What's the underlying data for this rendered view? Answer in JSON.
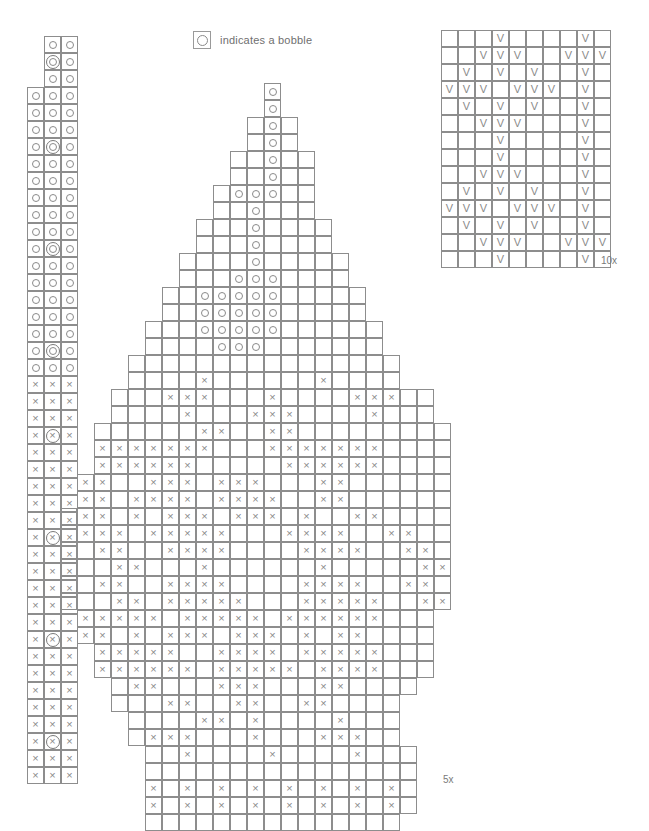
{
  "legend": {
    "icon": "bobble-circle-icon",
    "text": "indicates a bobble"
  },
  "labels": {
    "right_panel_repeat": "10x",
    "main_panel_repeat": "5x"
  },
  "symbols": {
    "empty": "",
    "circle": "o",
    "cross": "x",
    "vee": "V",
    "circle_bobble": "o-bobble",
    "cross_bobble": "x-bobble"
  },
  "chart_data": {
    "type": "table",
    "title": "",
    "cell_px": 17,
    "left_panel": {
      "name": "edging-strip",
      "cols": 3,
      "rows": 44,
      "legend_note": "dot = bobble row every 6th row in center column",
      "grid": [
        [
          null,
          "o",
          "o"
        ],
        [
          null,
          "ob",
          "o"
        ],
        [
          null,
          "o",
          "o"
        ],
        [
          "o",
          "o",
          "o"
        ],
        [
          "o",
          "o",
          "o"
        ],
        [
          "o",
          "o",
          "o"
        ],
        [
          "o",
          "ob",
          "o"
        ],
        [
          "o",
          "o",
          "o"
        ],
        [
          "o",
          "o",
          "o"
        ],
        [
          "o",
          "o",
          "o"
        ],
        [
          "o",
          "o",
          "o"
        ],
        [
          "o",
          "o",
          "o"
        ],
        [
          "o",
          "ob",
          "o"
        ],
        [
          "o",
          "o",
          "o"
        ],
        [
          "o",
          "o",
          "o"
        ],
        [
          "o",
          "o",
          "o"
        ],
        [
          "o",
          "o",
          "o"
        ],
        [
          "o",
          "o",
          "o"
        ],
        [
          "o",
          "ob",
          "o"
        ],
        [
          "o",
          "o",
          "o"
        ],
        [
          "x",
          "x",
          "x"
        ],
        [
          "x",
          "x",
          "x"
        ],
        [
          "x",
          "x",
          "x"
        ],
        [
          "x",
          "xb",
          "x"
        ],
        [
          "x",
          "x",
          "x"
        ],
        [
          "x",
          "x",
          "x"
        ],
        [
          "x",
          "x",
          "x"
        ],
        [
          "x",
          "x",
          "x"
        ],
        [
          "x",
          "x",
          "x"
        ],
        [
          "x",
          "xb",
          "x"
        ],
        [
          "x",
          "x",
          "x"
        ],
        [
          "x",
          "x",
          "x"
        ],
        [
          "x",
          "x",
          "x"
        ],
        [
          "x",
          "x",
          "x"
        ],
        [
          "x",
          "x",
          "x"
        ],
        [
          "x",
          "xb",
          "x"
        ],
        [
          "x",
          "x",
          "x"
        ],
        [
          "x",
          "x",
          "x"
        ],
        [
          "x",
          "x",
          "x"
        ],
        [
          "x",
          "x",
          "x"
        ],
        [
          "x",
          "x",
          "x"
        ],
        [
          "x",
          "xb",
          "x"
        ],
        [
          "x",
          "x",
          "x"
        ],
        [
          "x",
          "x",
          "x"
        ]
      ]
    },
    "right_panel": {
      "name": "lace-repeat-panel",
      "cols": 10,
      "rows": 14,
      "repeat": "10x",
      "grid": [
        [
          "",
          "",
          "",
          "v",
          "",
          "",
          "",
          "",
          "v",
          ""
        ],
        [
          "",
          "",
          "v",
          "v",
          "v",
          "",
          "",
          "v",
          "v",
          "v"
        ],
        [
          "",
          "v",
          "",
          "v",
          "",
          "v",
          "",
          "",
          "v",
          ""
        ],
        [
          "v",
          "v",
          "v",
          "",
          "v",
          "v",
          "v",
          "",
          "v",
          ""
        ],
        [
          "",
          "v",
          "",
          "v",
          "",
          "v",
          "",
          "",
          "v",
          ""
        ],
        [
          "",
          "",
          "v",
          "v",
          "v",
          "",
          "",
          "",
          "v",
          ""
        ],
        [
          "",
          "",
          "",
          "v",
          "",
          "",
          "",
          "",
          "v",
          ""
        ],
        [
          "",
          "",
          "",
          "v",
          "",
          "",
          "",
          "",
          "v",
          ""
        ],
        [
          "",
          "",
          "v",
          "v",
          "v",
          "",
          "",
          "",
          "v",
          ""
        ],
        [
          "",
          "v",
          "",
          "v",
          "",
          "v",
          "",
          "",
          "v",
          ""
        ],
        [
          "v",
          "v",
          "v",
          "",
          "v",
          "v",
          "v",
          "",
          "v",
          ""
        ],
        [
          "",
          "v",
          "",
          "v",
          "",
          "v",
          "",
          "",
          "v",
          ""
        ],
        [
          "",
          "",
          "v",
          "v",
          "v",
          "",
          "",
          "v",
          "v",
          "v"
        ],
        [
          "",
          "",
          "",
          "v",
          "",
          "",
          "",
          "",
          "v",
          ""
        ]
      ]
    },
    "main_panel": {
      "name": "teardrop-leaf-motif",
      "cols": 24,
      "rows": 44,
      "repeat": "5x",
      "note": "grid rows give [start_col, cells...]; null = cell outside motif outline",
      "grid": [
        [
          12,
          [
            "o"
          ]
        ],
        [
          12,
          [
            "o"
          ]
        ],
        [
          11,
          [
            "",
            "o",
            ""
          ]
        ],
        [
          11,
          [
            "",
            "o",
            ""
          ]
        ],
        [
          10,
          [
            "",
            "",
            "o",
            "",
            ""
          ]
        ],
        [
          10,
          [
            "",
            "",
            "o",
            "",
            ""
          ]
        ],
        [
          9,
          [
            "",
            "o",
            "o",
            "o",
            "",
            ""
          ]
        ],
        [
          9,
          [
            "",
            "",
            "o",
            "",
            "",
            ""
          ]
        ],
        [
          8,
          [
            "",
            "",
            "",
            "o",
            "",
            "",
            "",
            ""
          ]
        ],
        [
          8,
          [
            "",
            "",
            "",
            "o",
            "",
            "",
            "",
            ""
          ]
        ],
        [
          7,
          [
            "",
            "",
            "",
            "",
            "o",
            "",
            "",
            "",
            "",
            ""
          ]
        ],
        [
          7,
          [
            "",
            "",
            "",
            "o",
            "o",
            "o",
            "",
            "",
            "",
            ""
          ]
        ],
        [
          6,
          [
            "",
            "",
            "o",
            "o",
            "o",
            "o",
            "o",
            "",
            "",
            "",
            "",
            ""
          ]
        ],
        [
          6,
          [
            "",
            "",
            "o",
            "o",
            "o",
            "o",
            "o",
            "",
            "",
            "",
            "",
            ""
          ]
        ],
        [
          5,
          [
            "",
            "",
            "",
            "o",
            "o",
            "o",
            "o",
            "o",
            "",
            "",
            "",
            "",
            "",
            ""
          ]
        ],
        [
          5,
          [
            "",
            "",
            "",
            "",
            "o",
            "o",
            "o",
            "",
            "",
            "",
            "",
            "",
            "",
            ""
          ]
        ],
        [
          4,
          [
            "",
            "",
            "",
            "",
            "",
            "",
            "",
            "",
            "",
            "",
            "",
            "",
            "",
            "",
            "",
            ""
          ]
        ],
        [
          4,
          [
            "",
            "",
            "",
            "",
            "x",
            "",
            "",
            "",
            "",
            "",
            "",
            "x",
            "",
            "",
            "",
            ""
          ]
        ],
        [
          3,
          [
            "",
            "",
            "",
            "x",
            "x",
            "x",
            "",
            "",
            "",
            "x",
            "",
            "",
            "",
            "",
            "x",
            "x",
            "x",
            "",
            ""
          ]
        ],
        [
          3,
          [
            "",
            "",
            "",
            "",
            "x",
            "",
            "",
            "",
            "x",
            "x",
            "x",
            "",
            "",
            "",
            "",
            "x",
            "",
            "",
            ""
          ]
        ],
        [
          2,
          [
            "",
            "",
            "",
            "",
            "",
            "",
            "x",
            "x",
            "",
            "",
            "x",
            "x",
            "",
            "",
            "",
            "",
            "",
            "",
            "",
            "",
            ""
          ]
        ],
        [
          2,
          [
            "x",
            "x",
            "x",
            "x",
            "x",
            "x",
            "x",
            "",
            "",
            "",
            "x",
            "x",
            "x",
            "x",
            "x",
            "x",
            "x",
            "",
            "",
            "",
            ""
          ]
        ],
        [
          2,
          [
            "x",
            "x",
            "x",
            "x",
            "x",
            "x",
            "",
            "",
            "",
            "",
            "",
            "x",
            "x",
            "x",
            "x",
            "x",
            "x",
            "",
            "",
            "",
            ""
          ]
        ],
        [
          1,
          [
            "x",
            "x",
            "",
            "",
            "x",
            "x",
            "x",
            "",
            "x",
            "x",
            "x",
            "",
            "",
            "",
            "x",
            "x",
            "",
            "",
            "",
            "",
            "",
            ""
          ]
        ],
        [
          1,
          [
            "x",
            "x",
            "",
            "x",
            "x",
            "x",
            "x",
            "",
            "x",
            "x",
            "x",
            "x",
            "",
            "",
            "x",
            "x",
            "",
            "",
            "",
            "",
            "",
            ""
          ]
        ],
        [
          0,
          [
            "",
            "x",
            "x",
            "",
            "x",
            "",
            "x",
            "x",
            "x",
            "",
            "x",
            "x",
            "x",
            "",
            "x",
            "",
            "",
            "x",
            "x",
            "",
            "",
            "",
            ""
          ]
        ],
        [
          0,
          [
            "",
            "x",
            "x",
            "x",
            "",
            "x",
            "x",
            "x",
            "x",
            "x",
            "",
            "",
            "",
            "x",
            "x",
            "x",
            "x",
            "",
            "",
            "x",
            "x",
            "",
            ""
          ]
        ],
        [
          0,
          [
            "",
            "",
            "x",
            "x",
            "",
            "",
            "x",
            "x",
            "x",
            "x",
            "",
            "",
            "",
            "",
            "x",
            "x",
            "x",
            "x",
            "",
            "",
            "x",
            "x",
            ""
          ]
        ],
        [
          0,
          [
            "",
            "",
            "",
            "x",
            "x",
            "",
            "",
            "",
            "x",
            "",
            "",
            "",
            "",
            "",
            "",
            "x",
            "",
            "",
            "",
            "",
            "",
            "x",
            "x"
          ]
        ],
        [
          0,
          [
            "",
            "",
            "x",
            "x",
            "",
            "",
            "x",
            "x",
            "x",
            "x",
            "",
            "",
            "",
            "",
            "x",
            "x",
            "x",
            "x",
            "",
            "",
            "x",
            "x",
            ""
          ]
        ],
        [
          0,
          [
            "",
            "",
            "",
            "x",
            "x",
            "",
            "x",
            "x",
            "x",
            "x",
            "x",
            "",
            "",
            "",
            "x",
            "x",
            "x",
            "x",
            "x",
            "",
            "",
            "x",
            "x"
          ]
        ],
        [
          1,
          [
            "x",
            "x",
            "x",
            "x",
            "x",
            "",
            "x",
            "x",
            "x",
            "x",
            "x",
            "",
            "x",
            "x",
            "x",
            "x",
            "x",
            "x",
            "",
            "",
            ""
          ]
        ],
        [
          1,
          [
            "x",
            "x",
            "",
            "x",
            "",
            "x",
            "x",
            "x",
            "",
            "x",
            "x",
            "x",
            "",
            "x",
            "",
            "x",
            "x",
            "",
            "",
            "",
            ""
          ]
        ],
        [
          2,
          [
            "x",
            "x",
            "x",
            "x",
            "x",
            "",
            "",
            "x",
            "x",
            "x",
            "x",
            "",
            "x",
            "x",
            "x",
            "x",
            "x",
            "",
            "",
            ""
          ]
        ],
        [
          2,
          [
            "x",
            "x",
            "x",
            "x",
            "x",
            "x",
            "",
            "x",
            "x",
            "x",
            "x",
            "x",
            "",
            "x",
            "x",
            "x",
            "x",
            "",
            "",
            ""
          ]
        ],
        [
          3,
          [
            "",
            "x",
            "x",
            "",
            "",
            "",
            "x",
            "x",
            "x",
            "",
            "",
            "",
            "x",
            "x",
            "",
            "",
            "",
            ""
          ]
        ],
        [
          3,
          [
            "",
            "",
            "",
            "x",
            "x",
            "",
            "",
            "x",
            "x",
            "",
            "",
            "x",
            "x",
            "",
            "",
            "",
            ""
          ]
        ],
        [
          4,
          [
            "",
            "",
            "",
            "",
            "x",
            "x",
            "",
            "x",
            "",
            "",
            "",
            "",
            "x",
            "",
            "",
            ""
          ]
        ],
        [
          4,
          [
            "",
            "x",
            "x",
            "x",
            "",
            "",
            "",
            "x",
            "",
            "",
            "",
            "x",
            "x",
            "x",
            "",
            ""
          ]
        ],
        [
          5,
          [
            "",
            "",
            "x",
            "",
            "",
            "",
            "",
            "x",
            "",
            "",
            "",
            "",
            "x",
            "",
            "",
            ""
          ]
        ],
        [
          5,
          [
            "",
            "",
            "",
            "",
            "",
            "",
            "",
            "",
            "",
            "",
            "",
            "",
            "",
            "",
            "",
            ""
          ]
        ],
        [
          5,
          [
            "x",
            "",
            "x",
            "",
            "x",
            "",
            "x",
            "",
            "x",
            "",
            "x",
            "",
            "x",
            "",
            "x",
            ""
          ]
        ],
        [
          5,
          [
            "x",
            "",
            "x",
            "",
            "x",
            "",
            "x",
            "",
            "x",
            "",
            "x",
            "",
            "x",
            "",
            "x",
            ""
          ]
        ],
        [
          5,
          [
            "",
            "",
            "",
            "",
            "",
            "",
            "",
            "",
            "",
            "",
            "",
            "",
            "",
            "",
            ""
          ]
        ]
      ]
    }
  }
}
